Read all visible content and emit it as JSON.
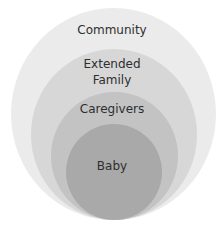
{
  "diagram": {
    "type": "nested-circles",
    "layers": [
      {
        "label": "Community",
        "color": "#ebebeb"
      },
      {
        "label_line1": "Extended",
        "label_line2": "Family",
        "color": "#d7d7d7"
      },
      {
        "label": "Caregivers",
        "color": "#c3c3c3"
      },
      {
        "label": "Baby",
        "color": "#a9a9a9"
      }
    ]
  }
}
